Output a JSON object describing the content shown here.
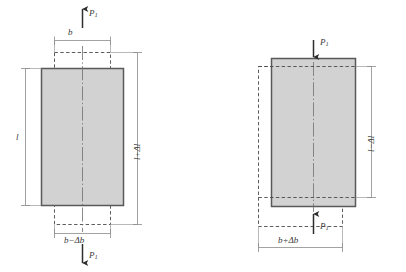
{
  "figure": {
    "colors": {
      "bar_fill": "#d2d2d2",
      "bar_stroke": "#595959",
      "line": "#8a8a8a",
      "dash": "#4a4a4a",
      "text": "#3a3a3a",
      "background": "#ffffff"
    }
  },
  "tension": {
    "name": "tension-case",
    "load_top": {
      "symbol": "P",
      "subscript": "1",
      "direction": "up"
    },
    "load_bottom": {
      "symbol": "P",
      "subscript": "1",
      "direction": "down"
    },
    "width_original": "b",
    "width_deformed": {
      "base": "b",
      "operator": "−",
      "delta": "Δb"
    },
    "length_original": "l",
    "length_deformed": {
      "base": "l",
      "operator": "+",
      "delta": "Δl"
    },
    "solid_shape": "deformed-bar",
    "dashed_shape": "original-outline"
  },
  "compression": {
    "name": "compression-case",
    "load_top": {
      "symbol": "P",
      "subscript": "1",
      "direction": "down"
    },
    "load_bottom": {
      "symbol": "P",
      "subscript": "1",
      "direction": "up"
    },
    "width_deformed": {
      "base": "b",
      "operator": "+",
      "delta": "Δb"
    },
    "length_deformed": {
      "base": "l",
      "operator": "−",
      "delta": "Δl"
    },
    "solid_shape": "deformed-bar",
    "dashed_shape": "original-outline"
  },
  "labels": {
    "p_top_left": "P",
    "p_top_left_sub": "1",
    "p_bottom_left": "P",
    "p_bottom_left_sub": "1",
    "b_top": "b",
    "b_minus_db": "b−Δb",
    "l_left": "l",
    "l_plus_dl": "l+Δl",
    "p_top_right": "P",
    "p_top_right_sub": "1",
    "p_bottom_right": "P",
    "p_bottom_right_sub": "1",
    "b_plus_db": "b+Δb",
    "l_minus_dl": "l−Δl"
  }
}
